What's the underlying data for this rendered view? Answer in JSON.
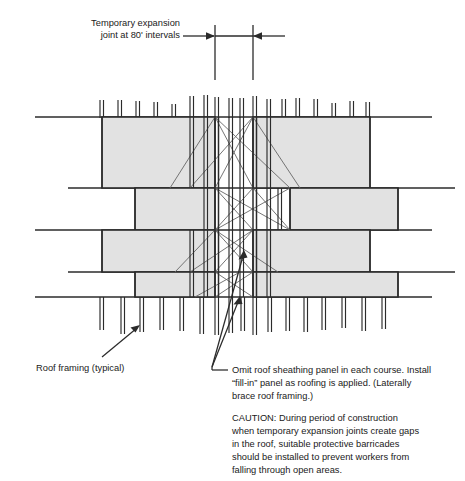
{
  "figure": {
    "type": "construction-detail-diagram",
    "colors": {
      "panel_fill": "#e2e2e2",
      "line": "#2b2b2b",
      "thin_line": "#555555",
      "background": "#ffffff",
      "text": "#1a1a1a"
    }
  },
  "labels": {
    "top_note_line1": "Temporary expansion",
    "top_note_line2": "joint at 80' intervals",
    "roof_framing_label": "Roof framing (typical)",
    "omit_panel_line1": "Omit roof sheathing panel in each course. Install",
    "omit_panel_line2": "“fill-in” panel as roofing is applied. (Laterally",
    "omit_panel_line3": "brace roof framing.)",
    "caution_line1": "CAUTION: During period of construction",
    "caution_line2": "when temporary expansion joints create gaps",
    "caution_line3": "in the roof, suitable protective barricades",
    "caution_line4": "should be installed to prevent workers from",
    "caution_line5": "falling through open areas."
  },
  "dimension": {
    "interval_value": "80'",
    "description": "Temporary expansion joint at 80' intervals",
    "left_joint_x": 215,
    "right_joint_x": 253,
    "arrow_row_y": 36
  },
  "geometry": {
    "joint_left_x": 215,
    "joint_right_x": 253,
    "courses": [
      {
        "index": 1,
        "top": 117,
        "bottom": 188,
        "left_panel_x1": 102,
        "left_panel_x2": 215,
        "right_panel_x1": 253,
        "right_panel_x2": 370,
        "line_left_start": 35,
        "line_right_end": 432
      },
      {
        "index": 2,
        "top": 188,
        "bottom": 230,
        "left_panel_x1": 135,
        "left_panel_x2": 215,
        "right_panel_x1": 253,
        "right_panel_x2": 398,
        "line_left_start": 68,
        "line_right_end": 455
      },
      {
        "index": 3,
        "top": 230,
        "bottom": 272,
        "left_panel_x1": 102,
        "left_panel_x2": 215,
        "right_panel_x1": 253,
        "right_panel_x2": 370,
        "line_left_start": 35,
        "line_right_end": 432
      },
      {
        "index": 4,
        "top": 272,
        "bottom": 297,
        "left_panel_x1": 135,
        "left_panel_x2": 215,
        "right_panel_x1": 253,
        "right_panel_x2": 398,
        "line_left_start": 68,
        "line_right_end": 455
      }
    ],
    "top_framing_ticks_y": [
      98,
      117
    ],
    "bottom_framing_ticks_y": [
      297,
      330
    ],
    "framing_tick_xs": [
      100,
      118,
      136,
      154,
      172,
      190,
      204,
      215,
      226,
      240,
      253,
      264,
      278,
      296,
      314,
      332,
      350,
      364
    ]
  },
  "elements": {
    "panel_name": "roof-sheathing-panel",
    "joist_name": "roof-framing-member",
    "brace_name": "lateral-brace-line",
    "joint_line_name": "expansion-joint-line"
  }
}
